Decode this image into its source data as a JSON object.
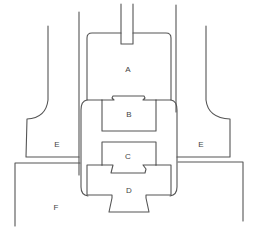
{
  "diagram": {
    "type": "mechanical cross-section",
    "labels": {
      "A": "A",
      "B": "B",
      "C": "C",
      "D": "D",
      "E_left": "E",
      "E_right": "E",
      "F": "F"
    },
    "colors": {
      "stroke": "#555555",
      "label": "#444444",
      "background": "#ffffff"
    }
  }
}
